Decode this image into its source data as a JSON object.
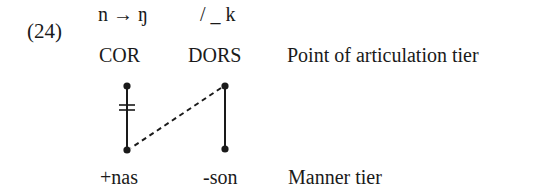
{
  "example": {
    "number": "(24)",
    "rule": "n → ŋ",
    "environment": "/ _ k"
  },
  "tiers": {
    "articulation": {
      "label": "Point of articulation tier",
      "nodes": [
        "COR",
        "DORS"
      ]
    },
    "manner": {
      "label": "Manner tier",
      "nodes": [
        "+nas",
        "-son"
      ]
    }
  },
  "associations": [
    {
      "from": "COR",
      "to": "+nas",
      "style": "solid",
      "delinked": true
    },
    {
      "from": "DORS",
      "to": "-son",
      "style": "solid",
      "delinked": false
    },
    {
      "from": "DORS",
      "to": "+nas",
      "style": "dashed",
      "delinked": false
    }
  ],
  "colors": {
    "ink": "#1a1a1a",
    "background": "#ffffff"
  }
}
